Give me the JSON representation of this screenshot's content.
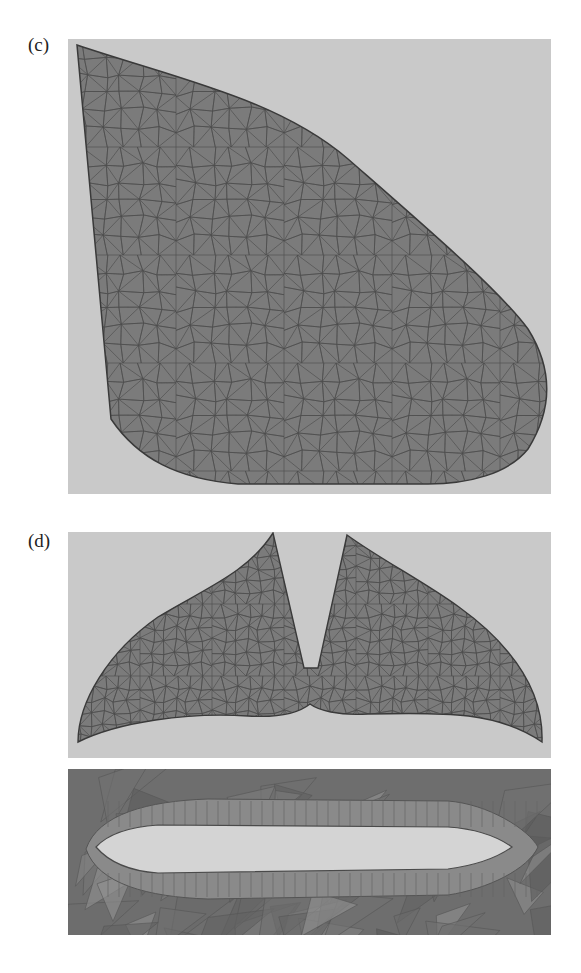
{
  "figure": {
    "panels": [
      {
        "id": "c",
        "label": "(c)",
        "description": "Triangular surface mesh of a rounded quadrilateral fin-like planform"
      },
      {
        "id": "d",
        "label": "(d)",
        "description": "Triangular surface mesh of a tail-fluke shaped planform with central notch"
      },
      {
        "id": "d-lower",
        "label": "",
        "description": "Cross-section mesh around an airfoil-shaped hole"
      }
    ]
  },
  "colors": {
    "background_panel": "#c9c9c9",
    "mesh_fill": "#7b7b7b",
    "mesh_edge": "#4a4a4a",
    "boundary": "#3a3a3a",
    "hole_fill": "#d4d4d4",
    "section_bg": "#6e6e6e"
  }
}
